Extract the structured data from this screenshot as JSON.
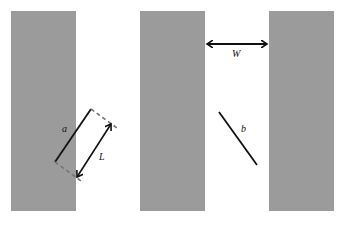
{
  "diagram": {
    "background": "#ffffff",
    "strip_color": "#9b9b9b",
    "line_color": "#111111",
    "dash_color": "#7a7a7a",
    "strips": [
      {
        "name": "left-strip",
        "x": 11,
        "y": 11,
        "width": 65,
        "height": 200
      },
      {
        "name": "middle-strip",
        "x": 140,
        "y": 11,
        "width": 65,
        "height": 200
      },
      {
        "name": "right-strip",
        "x": 269,
        "y": 11,
        "width": 65,
        "height": 200
      }
    ],
    "labels": {
      "a": "a",
      "L": "L",
      "W": "W",
      "b": "b"
    }
  }
}
